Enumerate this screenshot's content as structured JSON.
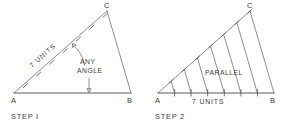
{
  "figure": {
    "ink_color": "#4a4a4a",
    "background": "#ffffff",
    "divisions": 7
  },
  "step1": {
    "caption": "STEP I",
    "vertices": {
      "a": "A",
      "b": "B",
      "c": "C"
    },
    "hypotenuse_label": "7 UNITS",
    "angle_label_line1": "ANY",
    "angle_label_line2": "ANGLE",
    "tick_count": 7
  },
  "step2": {
    "caption": "STEP 2",
    "vertices": {
      "a": "A",
      "b": "B",
      "c": "C"
    },
    "base_label": "7 UNITS",
    "parallel_label": "PARALLEL",
    "tick_count": 7,
    "parallel_line_count": 6
  }
}
